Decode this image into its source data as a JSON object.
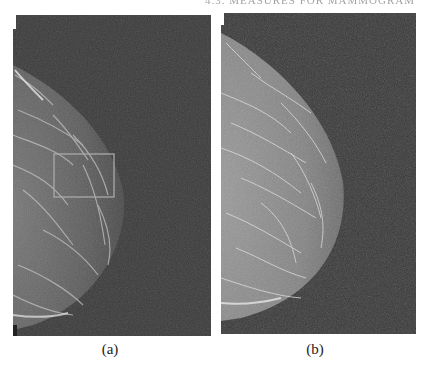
{
  "header": {
    "running_title": "4.3. MEASURES FOR MAMMOGRAM"
  },
  "figure": {
    "panels": [
      {
        "id": "a",
        "caption": "(a)",
        "description": "Mammogram (original), mediolateral view, breast on left edge",
        "roi_box": {
          "x": 41,
          "y": 139,
          "width": 60,
          "height": 43,
          "color": "#a9a9a9"
        },
        "background_color": "#3a3a3a",
        "tissue_color": "#6a6a6a"
      },
      {
        "id": "b",
        "caption": "(b)",
        "description": "Enhanced mammogram, same view",
        "background_color": "#383838",
        "tissue_color": "#8a8a8a"
      }
    ]
  }
}
